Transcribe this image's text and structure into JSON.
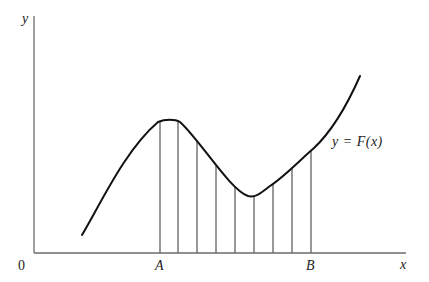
{
  "diagram": {
    "axes": {
      "x_label": "x",
      "y_label": "y",
      "origin_label": "0",
      "color": "#6b6b6b"
    },
    "curve": {
      "label": "y = F(x)",
      "color": "#111111",
      "path": "M 82 235 C 100 205, 125 150, 158 122 C 165 119, 175 119, 180 122 C 200 140, 230 190, 248 196 C 256 198, 262 192, 270 186 C 285 176, 300 160, 314 148 C 330 133, 345 110, 360 76"
    },
    "interval": {
      "start_label": "A",
      "end_label": "B",
      "partition_x": [
        160,
        178,
        197,
        216,
        235,
        254,
        273,
        292,
        311
      ],
      "line_color": "#333333"
    }
  }
}
